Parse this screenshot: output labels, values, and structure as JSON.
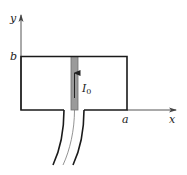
{
  "diagram": {
    "axes": {
      "y_label": "y",
      "x_label": "x"
    },
    "labels": {
      "top_edge": "b",
      "right_edge": "a",
      "current_main": "I",
      "current_sub": "0"
    },
    "colors": {
      "line": "#1a1a1a",
      "axis": "#555555",
      "strip_fill": "#9a9a9a",
      "strip_stroke": "#6e6e6e",
      "arrow": "#222222"
    }
  }
}
